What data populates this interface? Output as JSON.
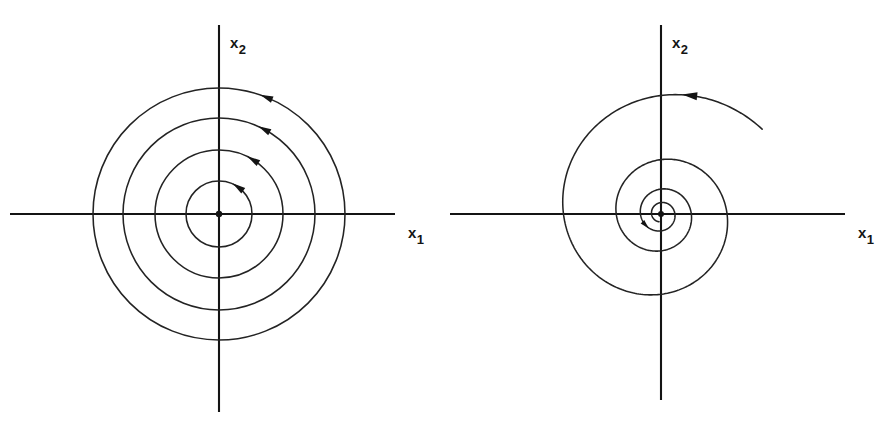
{
  "figure": {
    "background": "#ffffff",
    "stroke_color": "#232323",
    "axis_color": "#141414",
    "width": 876,
    "height": 428,
    "panel_count": 2
  },
  "panels": [
    {
      "id": "left",
      "name": "center-phase-portrait",
      "kind": "center",
      "axes": {
        "x_label_base": "x",
        "x_label_sub": "1",
        "y_label_base": "x",
        "y_label_sub": "2",
        "origin": [
          219,
          214
        ],
        "x_axis_from": 10,
        "x_axis_to": 395,
        "y_axis_from": 25,
        "y_axis_to": 412
      },
      "orbits": [
        {
          "radius": 33,
          "direction": "counter-clockwise",
          "arrow_angle_deg": 55
        },
        {
          "radius": 64,
          "direction": "counter-clockwise",
          "arrow_angle_deg": 58
        },
        {
          "radius": 96,
          "direction": "counter-clockwise",
          "arrow_angle_deg": 62
        },
        {
          "radius": 126,
          "direction": "counter-clockwise",
          "arrow_angle_deg": 68
        }
      ],
      "origin_dot": true
    },
    {
      "id": "right",
      "name": "stable-focus-phase-portrait",
      "kind": "stable-focus",
      "axes": {
        "x_label_base": "x",
        "x_label_sub": "1",
        "y_label_base": "x",
        "y_label_sub": "2",
        "origin": [
          661,
          214
        ],
        "x_axis_from": 450,
        "x_axis_to": 845,
        "y_axis_from": 25,
        "y_axis_to": 400
      },
      "spiral": {
        "direction": "counter-clockwise-inward",
        "turns": 3.6,
        "outer_radius": 132,
        "inner_radius": 8,
        "axis_crossings_left": [
          9,
          16,
          28,
          44,
          71,
          98
        ],
        "axis_crossings_right": [
          16,
          34,
          54,
          82,
          109
        ],
        "arrows": [
          {
            "name": "outer-arrow",
            "at_angle_deg": 100,
            "at_radius": 122
          },
          {
            "name": "inner-arrow",
            "at_angle_deg": 118,
            "at_radius": 19
          }
        ]
      },
      "origin_dot": true
    }
  ],
  "chart_data": {
    "type": "line",
    "title": "",
    "xlabel": "x1",
    "ylabel": "x2",
    "subplots": [
      {
        "name": "center",
        "description": "Four closed concentric circular orbits traversed counter-clockwise around the origin (a center).",
        "curve_type": "closed-orbits",
        "radii": [
          33,
          64,
          96,
          126
        ],
        "rotation": "counter-clockwise",
        "arrow_count": 4
      },
      {
        "name": "stable-focus",
        "description": "A single logarithmic spiral winding counter-clockwise inward toward the origin (a stable focus).",
        "curve_type": "logarithmic-spiral",
        "turns": 3.6,
        "r_start": 132,
        "r_end": 8,
        "rotation": "counter-clockwise-inward",
        "arrow_count": 2
      }
    ],
    "grid": false,
    "legend": "none",
    "axis_style": "cartesian-cross"
  }
}
